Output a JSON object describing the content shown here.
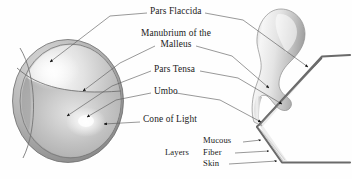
{
  "figure": {
    "background_color": "#fefefe",
    "text_color": "#1b1b1b",
    "line_color": "#5a5a5a"
  },
  "labels": {
    "pars_flaccida": "Pars Flaccida",
    "manubrium_line1": "Manubrium of the",
    "manubrium_line2": "Malleus",
    "pars_tensa": "Pars Tensa",
    "umbo": "Umbo",
    "cone_of_light": "Cone of Light",
    "layers_group": "Layers",
    "layer_mucous": "Mucous",
    "layer_fiber": "Fiber",
    "layer_skin": "Skin"
  },
  "left_view": {
    "name": "tympanic-membrane-surface-view",
    "shape": "oval",
    "center": [
      68,
      101
    ],
    "radius_x": 56,
    "radius_y": 62,
    "annulus_ring": true,
    "highlight_region": "upper-left",
    "cone_of_light_highlight": "lower-center",
    "divider_line": "pars-flaccida-pars-tensa-boundary",
    "colors": {
      "rim_outer": "#8d8d8d",
      "rim_inner": "#b9b9b9",
      "upper_light": "#f2f2f2",
      "lower_shade": "#a9a9a9",
      "specular": "#ffffff"
    }
  },
  "right_view": {
    "name": "cross-section-view",
    "malleus_bone": {
      "label_ref": "manubrium_of_the_malleus",
      "head_center": [
        282,
        36
      ],
      "handle_tip": [
        259,
        124
      ],
      "colors": {
        "light": "#f4f4f4",
        "mid": "#cfcfcf",
        "shade": "#9d9d9d"
      }
    },
    "membrane_line": {
      "from": [
        322,
        58
      ],
      "to": [
        258,
        125
      ]
    },
    "canal_wall": {
      "apex_top": [
        322,
        58
      ],
      "bend": [
        258,
        126
      ],
      "lower_bend": [
        282,
        163
      ],
      "top_horizontal_to": [
        350,
        56
      ],
      "bottom_horizontal_to": [
        350,
        163
      ]
    },
    "layer_count": 3
  },
  "arrows": {
    "into_membrane": [
      {
        "target_label": "pars_flaccida",
        "tip": [
          45,
          64
        ]
      },
      {
        "target_label": "manubrium",
        "tip": [
          78,
          93
        ]
      },
      {
        "target_label": "pars_tensa",
        "tip": [
          62,
          118
        ]
      },
      {
        "target_label": "umbo",
        "tip": [
          82,
          119
        ]
      },
      {
        "target_label": "cone_of_light",
        "tip": [
          99,
          125
        ]
      }
    ],
    "into_cross_section": [
      {
        "target_label": "pars_flaccida",
        "tip": [
          311,
          69
        ]
      },
      {
        "target_label": "manubrium",
        "tip": [
          266,
          90
        ]
      },
      {
        "target_label": "pars_tensa",
        "tip": [
          279,
          106
        ]
      },
      {
        "target_label": "umbo",
        "tip": [
          258,
          124
        ]
      },
      {
        "target_label": "layer_mucous",
        "tip": [
          263,
          141
        ]
      },
      {
        "target_label": "layer_fiber",
        "tip": [
          271,
          152
        ]
      },
      {
        "target_label": "layer_skin",
        "tip": [
          279,
          162
        ]
      }
    ]
  }
}
